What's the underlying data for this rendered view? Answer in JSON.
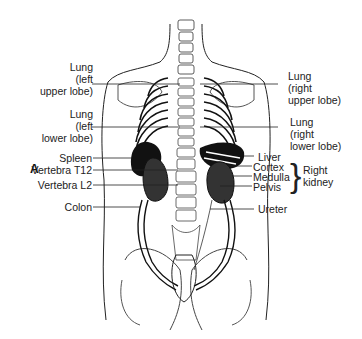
{
  "figure": {
    "panel_label": "A",
    "left_labels": [
      {
        "id": "lung-left-upper",
        "lines": [
          "Lung",
          "(left",
          "upper lobe)"
        ]
      },
      {
        "id": "lung-left-lower",
        "lines": [
          "Lung",
          "(left",
          "lower lobe)"
        ]
      },
      {
        "id": "spleen",
        "text": "Spleen"
      },
      {
        "id": "vertebra-t12",
        "text": "Vertebra T12"
      },
      {
        "id": "vertebra-l2",
        "text": "Vertebra L2"
      },
      {
        "id": "colon",
        "text": "Colon"
      }
    ],
    "right_labels": [
      {
        "id": "lung-right-upper",
        "lines": [
          "Lung",
          "(right",
          "upper lobe)"
        ]
      },
      {
        "id": "lung-right-lower",
        "lines": [
          "Lung",
          "(right",
          "lower lobe)"
        ]
      },
      {
        "id": "liver",
        "text": "Liver"
      },
      {
        "id": "cortex",
        "text": "Cortex"
      },
      {
        "id": "medulla",
        "text": "Medulla"
      },
      {
        "id": "pelvis",
        "text": "Pelvis"
      },
      {
        "id": "ureter",
        "text": "Ureter"
      }
    ],
    "group_label": {
      "lines": [
        "Right",
        "kidney"
      ]
    },
    "colors": {
      "ink": "#1a1a1a",
      "background": "#ffffff",
      "organ_fill": "#111111"
    }
  }
}
